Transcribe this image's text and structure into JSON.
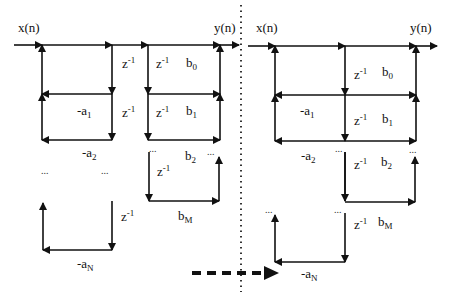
{
  "diagram": {
    "colors": {
      "line": "#111111",
      "background": "#ffffff"
    },
    "left": {
      "input_label": "x(n)",
      "output_label": "y(n)",
      "delay": "z",
      "delay_exp": "-1",
      "feedback": [
        {
          "base": "-a",
          "sub": "1"
        },
        {
          "base": "-a",
          "sub": "2"
        },
        {
          "base": "-a",
          "sub": "N"
        }
      ],
      "feedforward": [
        {
          "base": "b",
          "sub": "0"
        },
        {
          "base": "b",
          "sub": "1"
        },
        {
          "base": "b",
          "sub": "2"
        },
        {
          "base": "b",
          "sub": "M"
        }
      ],
      "ellipsis": "..."
    },
    "right": {
      "input_label": "x(n)",
      "output_label": "y(n)",
      "delay": "z",
      "delay_exp": "-1",
      "feedback": [
        {
          "base": "-a",
          "sub": "1"
        },
        {
          "base": "-a",
          "sub": "2"
        },
        {
          "base": "-a",
          "sub": "N"
        }
      ],
      "feedforward": [
        {
          "base": "b",
          "sub": "0"
        },
        {
          "base": "b",
          "sub": "1"
        },
        {
          "base": "b",
          "sub": "2"
        },
        {
          "base": "b",
          "sub": "M"
        }
      ],
      "ellipsis": "..."
    },
    "transform_arrow": "dashed-right-arrow"
  }
}
